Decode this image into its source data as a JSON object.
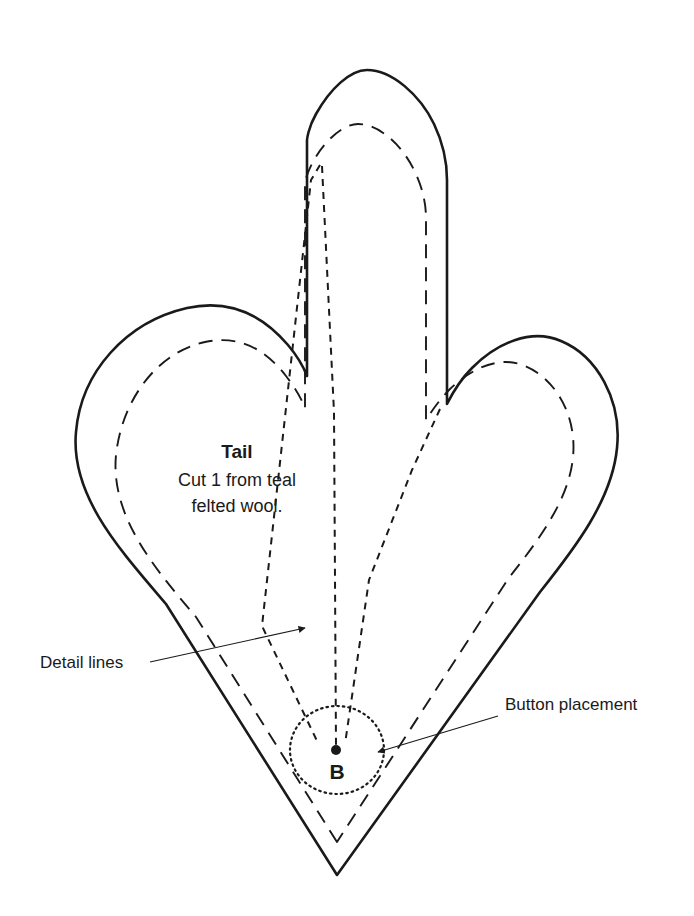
{
  "document": {
    "type": "sewing-pattern-template",
    "title": "Tail pattern piece",
    "background_color": "#ffffff",
    "ink_color": "#1a1a1a"
  },
  "piece_label": {
    "name": "Tail",
    "instruction_line_1": "Cut 1 from teal",
    "instruction_line_2": "felted wool."
  },
  "callouts": [
    {
      "id": "detail-lines",
      "text": "Detail lines",
      "text_x": 40,
      "text_y": 668,
      "leader_from_x": 150,
      "leader_from_y": 662,
      "leader_to_x": 305,
      "leader_to_y": 628,
      "arrow": "end"
    },
    {
      "id": "button-placement",
      "text": "Button placement",
      "text_x": 505,
      "text_y": 710,
      "leader_from_x": 498,
      "leader_from_y": 716,
      "leader_to_x": 378,
      "leader_to_y": 752,
      "arrow": "end"
    }
  ],
  "button_marker": {
    "letter": "B",
    "letter_x": 337,
    "letter_y": 779,
    "dot_x": 336,
    "dot_y": 750,
    "dot_radius": 5,
    "circle_cx": 337,
    "circle_cy": 750,
    "circle_rx": 47,
    "circle_ry": 44,
    "circle_style": "dotted"
  },
  "geometry": {
    "outline_stroke_width": 2.6,
    "seam_stroke_width": 1.9,
    "seam_dash": "14 9",
    "detail_stroke_width": 2.0,
    "detail_dash": "7 6",
    "button_circle_dash": "1.5 4",
    "leader_stroke_width": 1.2,
    "outline_path": "M 337 875 L 166 604 C 121 551 70 496 76 432 C 81 372 126 322 187 308 C 232 298 265 318 288 345 C 298 357 304 368 307 376 L 307 140 C 307 140 308 128 316 114 C 330 89 350 70 367 70 C 392 70 420 95 434 124 C 445 147 447 167 447 180 L 447 404 C 452 394 460 380 472 368 C 497 343 531 328 561 341 C 597 356 622 400 617 448 C 612 500 575 548 540 592 Z",
    "seam_path": "M 337 842 L 196 617 C 158 572 110 518 116 455 C 122 399 158 352 205 342 C 243 334 268 353 286 376 C 296 389 302 400 305 408 L 305 182 C 305 182 307 172 314 160 C 326 139 344 124 358 124 C 379 124 402 145 414 170 C 424 190 426 207 426 218 L 426 420 C 431 412 440 399 450 389 C 472 368 500 355 525 366 C 556 379 577 416 573 457 C 569 501 537 542 508 579 Z",
    "detail_lines": [
      {
        "id": "detail-line-left",
        "d": "M 320 165 L 311 180 L 285 417 L 262 626 L 318 743"
      },
      {
        "id": "detail-line-center",
        "d": "M 322 166 L 334 412 L 336 746"
      },
      {
        "id": "detail-line-right",
        "d": "M 440 409 L 412 470 L 369 580 L 345 744"
      }
    ]
  }
}
